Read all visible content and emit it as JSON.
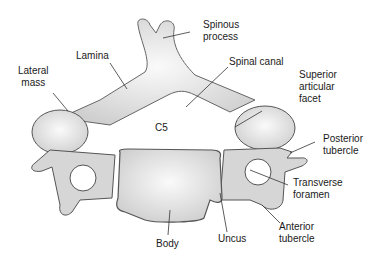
{
  "diagram": {
    "center_label": "C5",
    "labels": {
      "spinous_process": [
        "Spinous",
        "process"
      ],
      "lamina": "Lamina",
      "lateral_mass": [
        "Lateral",
        "mass"
      ],
      "spinal_canal": "Spinal canal",
      "superior_articular_facet": [
        "Superior",
        "articular",
        "facet"
      ],
      "posterior_tubercle": [
        "Posterior",
        "tubercle"
      ],
      "transverse_foramen": [
        "Transverse",
        "foramen"
      ],
      "anterior_tubercle": [
        "Anterior",
        "tubercle"
      ],
      "uncus": "Uncus",
      "body": "Body"
    },
    "colors": {
      "bone_fill": "#eeeeee",
      "bone_shade": "#c8c8c8",
      "outline": "#555555",
      "leader_line": "#333333",
      "text": "#1a1a1a"
    }
  }
}
